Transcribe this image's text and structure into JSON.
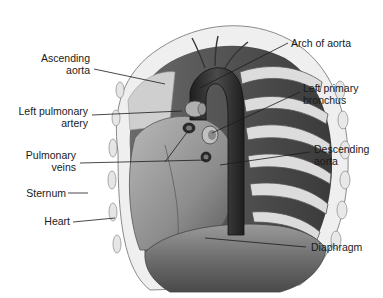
{
  "diagram": {
    "colors": {
      "background": "#ffffff",
      "ink": "#1a1a1a",
      "aorta": "#2e2e2e",
      "heart": "#8a8a8a",
      "diaphragm": "#7a7a7a",
      "ribs": "#d8d8d8"
    },
    "labels": {
      "ascending_aorta": [
        "Ascending",
        "aorta"
      ],
      "left_pulmonary_artery": [
        "Left pulmonary",
        "artery"
      ],
      "pulmonary_veins": [
        "Pulmonary",
        "veins"
      ],
      "sternum": [
        "Sternum"
      ],
      "heart": [
        "Heart"
      ],
      "arch_of_aorta": [
        "Arch of aorta"
      ],
      "left_primary_bronchus": [
        "Left primary",
        "bronchus"
      ],
      "descending_aorta": [
        "Descending",
        "aorta"
      ],
      "diaphragm": [
        "Diaphragm"
      ]
    }
  }
}
